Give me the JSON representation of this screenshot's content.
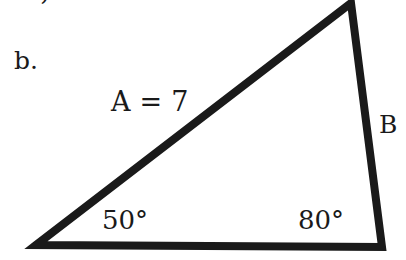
{
  "problem": {
    "previous_part_fragment": ")",
    "part_label": "b."
  },
  "triangle": {
    "stroke_color": "#1a1a1a",
    "fill_color": "#ffffff",
    "stroke_width": 8,
    "vertices": {
      "bottom_left": {
        "x": 36,
        "y": 245
      },
      "top": {
        "x": 351,
        "y": 3
      },
      "bottom_right": {
        "x": 382,
        "y": 247
      }
    },
    "sides": {
      "a": {
        "name": "A",
        "equals": "=",
        "value": "7",
        "text": "A = 7"
      },
      "b": {
        "name": "B",
        "text": "B"
      }
    },
    "angles": {
      "bottom_left": {
        "value": "50°"
      },
      "bottom_right": {
        "value": "80°"
      }
    }
  }
}
